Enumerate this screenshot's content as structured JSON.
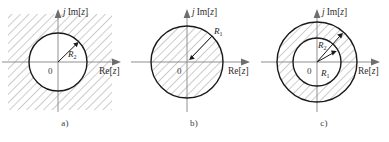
{
  "figure": {
    "name": "roc-region-of-convergence-diagrams",
    "background_color": "#ffffff",
    "line_color": "#1a1a1a",
    "axis_color": "#8a8a8a",
    "hatch_color": "#9a9a9a"
  },
  "panels": [
    {
      "id": "a",
      "caption": "a)",
      "imaginary_axis_label_prefix": "j",
      "imaginary_axis_label": "Im[",
      "imaginary_axis_var": "z",
      "imaginary_axis_close": "]",
      "real_axis_label": "Re[",
      "real_axis_var": "z",
      "real_axis_close": "]",
      "origin_label": "0",
      "radius_labels": [
        {
          "symbol": "R",
          "subscript": "2"
        }
      ],
      "shaded_region": "exterior-of-circle",
      "shading_style": "diagonal-hatch"
    },
    {
      "id": "b",
      "caption": "b)",
      "imaginary_axis_label_prefix": "j",
      "imaginary_axis_label": "Im[",
      "imaginary_axis_var": "z",
      "imaginary_axis_close": "]",
      "real_axis_label": "Re[",
      "real_axis_var": "z",
      "real_axis_close": "]",
      "origin_label": "0",
      "radius_labels": [
        {
          "symbol": "R",
          "subscript": "1"
        }
      ],
      "shaded_region": "interior-of-circle",
      "shading_style": "diagonal-hatch"
    },
    {
      "id": "c",
      "caption": "c)",
      "imaginary_axis_label_prefix": "j",
      "imaginary_axis_label": "Im[",
      "imaginary_axis_var": "z",
      "imaginary_axis_close": "]",
      "real_axis_label": "Re[",
      "real_axis_var": "z",
      "real_axis_close": "]",
      "origin_label": "0",
      "radius_labels": [
        {
          "symbol": "R",
          "subscript": "2"
        },
        {
          "symbol": "R",
          "subscript": "1"
        }
      ],
      "shaded_region": "annulus-between-circles",
      "shading_style": "diagonal-hatch"
    }
  ]
}
